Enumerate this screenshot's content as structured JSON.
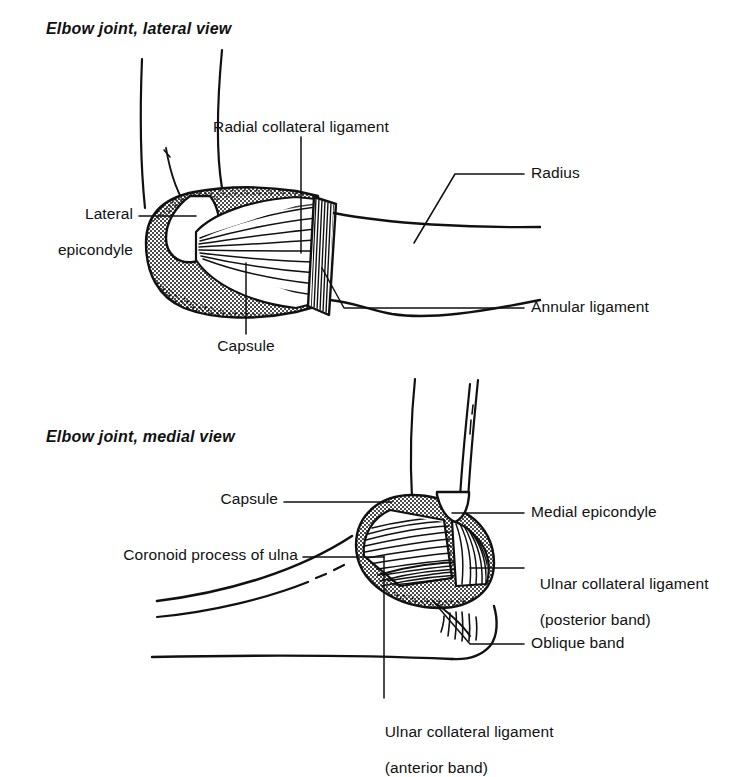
{
  "figure": {
    "background_color": "#ffffff",
    "ink_color": "#111111",
    "panels": [
      {
        "id": "lateral",
        "title": "Elbow joint, lateral view",
        "labels": [
          {
            "id": "radial-collateral-ligament",
            "text": "Radial collateral ligament"
          },
          {
            "id": "radius",
            "text": "Radius"
          },
          {
            "id": "annular-ligament",
            "text": "Annular ligament"
          },
          {
            "id": "lateral-epicondyle-line1",
            "text": "Lateral"
          },
          {
            "id": "lateral-epicondyle-line2",
            "text": "epicondyle"
          },
          {
            "id": "capsule",
            "text": "Capsule"
          }
        ]
      },
      {
        "id": "medial",
        "title": "Elbow joint, medial view",
        "labels": [
          {
            "id": "capsule",
            "text": "Capsule"
          },
          {
            "id": "coronoid-process-of-ulna",
            "text": "Coronoid process of ulna"
          },
          {
            "id": "medial-epicondyle",
            "text": "Medial epicondyle"
          },
          {
            "id": "ulnar-collateral-posterior-line1",
            "text": "Ulnar collateral ligament"
          },
          {
            "id": "ulnar-collateral-posterior-line2",
            "text": "(posterior band)"
          },
          {
            "id": "oblique-band",
            "text": "Oblique band"
          },
          {
            "id": "ulnar-collateral-anterior-line1",
            "text": "Ulnar collateral ligament"
          },
          {
            "id": "ulnar-collateral-anterior-line2",
            "text": "(anterior band)"
          }
        ]
      }
    ]
  }
}
